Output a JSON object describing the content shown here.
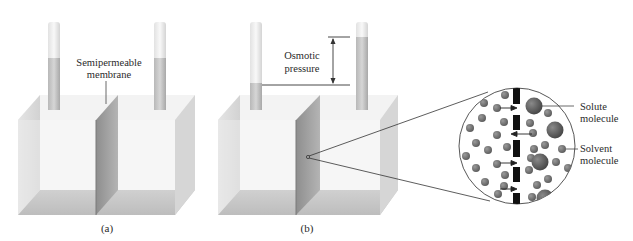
{
  "figure": {
    "panel_a": {
      "caption": "(a)",
      "membrane_label_line1": "Semipermeable",
      "membrane_label_line2": "membrane"
    },
    "panel_b": {
      "caption": "(b)",
      "pressure_label_line1": "Osmotic",
      "pressure_label_line2": "pressure"
    },
    "magnified_view": {
      "solute_label_line1": "Solute",
      "solute_label_line2": "molecule",
      "solvent_label_line1": "Solvent",
      "solvent_label_line2": "molecule"
    }
  },
  "colors": {
    "molecule": "#6e6e6e",
    "membrane_bar": "#111111",
    "container": "#e6e6e6",
    "membrane_panel": "#9a9a9a",
    "line": "#333333"
  }
}
